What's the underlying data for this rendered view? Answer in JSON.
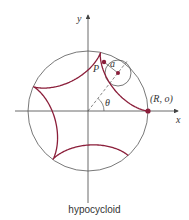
{
  "caption": "hypocycloid",
  "labels": {
    "x_axis": "x",
    "y_axis": "y",
    "point_p": "P",
    "radius_a": "a",
    "angle": "θ",
    "start_point": "(R, o)"
  },
  "colors": {
    "curve": "#8b1e3a",
    "axis": "#444444",
    "circle": "#555555",
    "dot": "#8b1e3a"
  },
  "geometry": {
    "origin": [
      88,
      111
    ],
    "big_radius": 60,
    "small_radius": 13,
    "small_circle_center": [
      118,
      73
    ],
    "point_p": [
      104,
      62
    ],
    "curve_end_angle_deg": 316,
    "x_axis_range": [
      15,
      178
    ],
    "y_axis_range": [
      15,
      203
    ]
  }
}
